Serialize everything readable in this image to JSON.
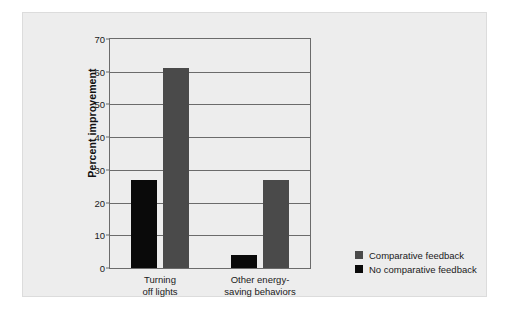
{
  "chart_data": {
    "type": "bar",
    "title": "",
    "subtitle": "",
    "xlabel": "",
    "ylabel": "Percent improvement",
    "ylim": [
      0,
      70
    ],
    "yticks": [
      0,
      10,
      20,
      30,
      40,
      50,
      60,
      70
    ],
    "ytick_labels": [
      "0",
      "10",
      "20",
      "30",
      "40",
      "50",
      "60",
      "70"
    ],
    "grid": true,
    "grid_axis": "y",
    "legend_position": "right",
    "categories": [
      "Turning off lights",
      "Other energy-saving behaviors"
    ],
    "category_label_lines": [
      [
        "Turning",
        "off lights"
      ],
      [
        "Other energy-",
        "saving behaviors"
      ]
    ],
    "series": [
      {
        "name": "No comparative feedback",
        "color": "#0a0a0a",
        "values": [
          27,
          4
        ]
      },
      {
        "name": "Comparative feedback",
        "color": "#4a4a4a",
        "values": [
          61,
          27
        ]
      }
    ],
    "legend_entries": [
      {
        "label": "Comparative feedback",
        "color": "#4a4a4a"
      },
      {
        "label": "No comparative feedback",
        "color": "#0a0a0a"
      }
    ],
    "annotations": []
  },
  "colors": {
    "panel_background": "#ededed",
    "axis": "#6b6b6b",
    "text": "#1a1a1a",
    "comparative_feedback": "#4a4a4a",
    "no_comparative_feedback": "#0a0a0a"
  }
}
